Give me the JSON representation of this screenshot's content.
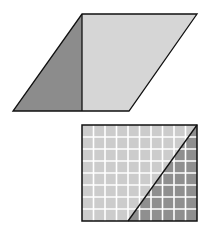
{
  "figure": {
    "parallelogram": {
      "points": "82,14 197,14 129,111 13,111",
      "dark_triangle": "82,14 82,111 13,111",
      "light_part": "82,14 197,14 129,111 82,111",
      "dark_color": "#8c8c8c",
      "light_color": "#d6d6d6"
    },
    "grid_rectangle": {
      "x": 82,
      "y": 125,
      "width": 115,
      "height": 96,
      "columns": 10,
      "rows": 8,
      "light_color": "#cccccc",
      "dark_color": "#8f8f8f",
      "grid_line_color": "#ffffff",
      "diagonal": {
        "x1": 197,
        "y1": 125,
        "x2": 128,
        "y2": 221
      }
    },
    "stroke_color": "#111111"
  }
}
